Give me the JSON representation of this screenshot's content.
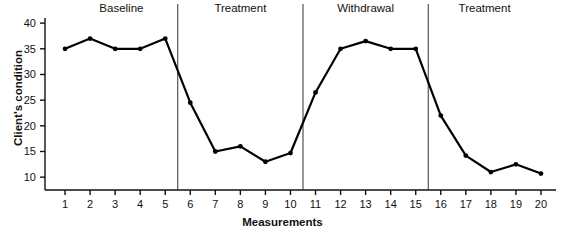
{
  "chart_data": {
    "type": "line",
    "title": "",
    "xlabel": "Measurements",
    "ylabel": "Client's condition",
    "x": [
      1,
      2,
      3,
      4,
      5,
      6,
      7,
      8,
      9,
      10,
      11,
      12,
      13,
      14,
      15,
      16,
      17,
      18,
      19,
      20
    ],
    "values": [
      35,
      37,
      35,
      35,
      37,
      24.5,
      15,
      16,
      13,
      14.7,
      26.5,
      35,
      36.5,
      35,
      35,
      22,
      14.2,
      11,
      12.5,
      10.7
    ],
    "series": [
      {
        "name": "Client's condition",
        "values": [
          35,
          37,
          35,
          35,
          37,
          24.5,
          15,
          16,
          13,
          14.7,
          26.5,
          35,
          36.5,
          35,
          35,
          22,
          14.2,
          11,
          12.5,
          10.7
        ]
      }
    ],
    "xlim": [
      0.2,
      20.6
    ],
    "ylim": [
      7.5,
      41
    ],
    "xticks": [
      1,
      2,
      3,
      4,
      5,
      6,
      7,
      8,
      9,
      10,
      11,
      12,
      13,
      14,
      15,
      16,
      17,
      18,
      19,
      20
    ],
    "xtick_labels": [
      "1",
      "2",
      "3",
      "4",
      "5",
      "6",
      "7",
      "8",
      "9",
      "10",
      "11",
      "12",
      "13",
      "14",
      "15",
      "16",
      "17",
      "18",
      "19",
      "20"
    ],
    "yticks": [
      10,
      15,
      20,
      25,
      30,
      35,
      40
    ],
    "ytick_labels": [
      "10",
      "15",
      "20",
      "25",
      "30",
      "35",
      "40"
    ],
    "grid": false,
    "legend": false,
    "line_color": "#000000",
    "marker": "circle",
    "marker_color": "#000000",
    "phase_lines": [
      5.5,
      10.5,
      15.5
    ],
    "phases": [
      {
        "label": "Baseline",
        "start": 1,
        "end": 5.5,
        "center_x": 100
      },
      {
        "label": "Treatment",
        "start": 5.5,
        "end": 10.5,
        "center_x": 235
      },
      {
        "label": "Withdrawal",
        "start": 10.5,
        "end": 15.5,
        "center_x": 363
      },
      {
        "label": "Treatment",
        "start": 15.5,
        "end": 20,
        "center_x": 492
      }
    ]
  }
}
